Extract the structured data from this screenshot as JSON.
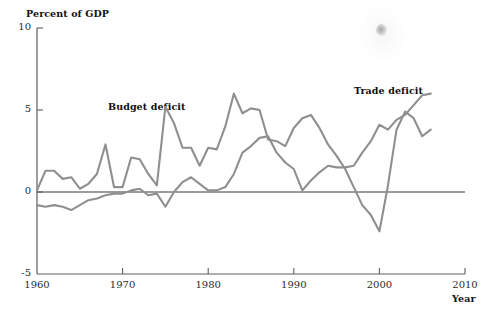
{
  "chart_data": {
    "type": "line",
    "title": "",
    "ylabel": "Percent of GDP",
    "xlabel": "Year",
    "ylim": [
      -5,
      10
    ],
    "xlim": [
      1960,
      2010
    ],
    "yticks": [
      "10",
      "5",
      "0",
      "-5"
    ],
    "ytick_values": [
      10,
      5,
      0,
      -5
    ],
    "xticks": [
      "1960",
      "1970",
      "1980",
      "1990",
      "2000",
      "2010"
    ],
    "xtick_values": [
      1960,
      1970,
      1980,
      1990,
      2000,
      2010
    ],
    "grid": false,
    "legend_position": "inline-annotations",
    "zero_line": 0,
    "annotations": [
      {
        "text": "Budget deficit",
        "x": 1968.5,
        "y": 5.6
      },
      {
        "text": "Trade deficit",
        "x": 1997.0,
        "y": 6.6
      }
    ],
    "series": [
      {
        "name": "Budget deficit",
        "color": "#8f8f8f",
        "x": [
          1960,
          1961,
          1962,
          1963,
          1964,
          1965,
          1966,
          1967,
          1968,
          1969,
          1970,
          1971,
          1972,
          1973,
          1974,
          1975,
          1976,
          1977,
          1978,
          1979,
          1980,
          1981,
          1982,
          1983,
          1984,
          1985,
          1986,
          1987,
          1988,
          1989,
          1990,
          1991,
          1992,
          1993,
          1994,
          1995,
          1996,
          1997,
          1998,
          1999,
          2000,
          2001,
          2002,
          2003,
          2004,
          2005,
          2006
        ],
        "values": [
          0.1,
          1.3,
          1.3,
          0.8,
          0.9,
          0.2,
          0.5,
          1.1,
          2.9,
          0.3,
          0.3,
          2.1,
          2.0,
          1.1,
          0.4,
          5.2,
          4.2,
          2.7,
          2.7,
          1.6,
          2.7,
          2.6,
          4.0,
          6.0,
          4.8,
          5.1,
          5.0,
          3.2,
          3.1,
          2.8,
          3.9,
          4.5,
          4.7,
          3.9,
          2.9,
          2.2,
          1.4,
          0.3,
          -0.8,
          -1.4,
          -2.4,
          0.4,
          3.8,
          4.9,
          4.5,
          3.4,
          3.8
        ]
      },
      {
        "name": "Trade deficit",
        "color": "#8f8f8f",
        "x": [
          1960,
          1961,
          1962,
          1963,
          1964,
          1965,
          1966,
          1967,
          1968,
          1969,
          1970,
          1971,
          1972,
          1973,
          1974,
          1975,
          1976,
          1977,
          1978,
          1979,
          1980,
          1981,
          1982,
          1983,
          1984,
          1985,
          1986,
          1987,
          1988,
          1989,
          1990,
          1991,
          1992,
          1993,
          1994,
          1995,
          1996,
          1997,
          1998,
          1999,
          2000,
          2001,
          2002,
          2003,
          2004,
          2005,
          2006
        ],
        "values": [
          -0.8,
          -0.9,
          -0.8,
          -0.9,
          -1.1,
          -0.8,
          -0.5,
          -0.4,
          -0.2,
          -0.1,
          -0.1,
          0.1,
          0.2,
          -0.2,
          -0.1,
          -0.9,
          0.0,
          0.6,
          0.9,
          0.5,
          0.1,
          0.1,
          0.3,
          1.1,
          2.4,
          2.8,
          3.3,
          3.4,
          2.4,
          1.8,
          1.4,
          0.1,
          0.7,
          1.2,
          1.6,
          1.5,
          1.5,
          1.6,
          2.4,
          3.1,
          4.1,
          3.8,
          4.4,
          4.7,
          5.3,
          5.9,
          6.0
        ]
      }
    ]
  }
}
